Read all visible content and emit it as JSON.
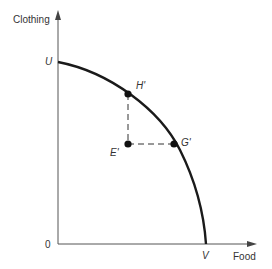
{
  "diagram": {
    "type": "production-possibility-frontier",
    "y_axis_label": "Clothing",
    "x_axis_label": "Food",
    "origin_label": "0",
    "curve": {
      "start_label": "U",
      "end_label": "V",
      "color": "#1a1a1a"
    },
    "points": [
      {
        "label": "H'",
        "on_curve": true
      },
      {
        "label": "G'",
        "on_curve": true
      },
      {
        "label": "E'",
        "on_curve": false
      }
    ],
    "dashed_lines": [
      {
        "from": "E'",
        "to": "H'",
        "direction": "vertical"
      },
      {
        "from": "E'",
        "to": "G'",
        "direction": "horizontal"
      }
    ]
  }
}
